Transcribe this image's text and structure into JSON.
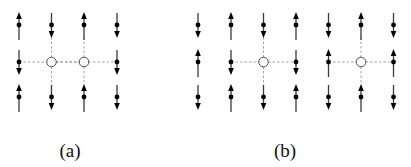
{
  "figure": {
    "panels": [
      {
        "id": "a",
        "label": "(a)",
        "label_pos": {
          "x": 70,
          "y": 140
        },
        "columns_x": [
          19,
          51.5,
          84,
          117
        ],
        "rows_y": [
          25,
          62,
          97
        ],
        "grid": [
          [
            "up",
            "down",
            "up",
            "down"
          ],
          [
            "down",
            "hole",
            "hole",
            "down"
          ],
          [
            "up",
            "down",
            "up",
            "down"
          ]
        ]
      },
      {
        "id": "b",
        "label": "(b)",
        "label_pos": {
          "x": 285,
          "y": 140
        },
        "columns_x": [
          198,
          231,
          263.5,
          296,
          328.5,
          361,
          393.5
        ],
        "rows_y": [
          25,
          62,
          97
        ],
        "grid": [
          [
            "down",
            "up",
            "down",
            "up",
            "down",
            "up",
            "down"
          ],
          [
            "up",
            "down",
            "hole",
            "down",
            "up",
            "hole",
            "up"
          ],
          [
            "down",
            "up",
            "down",
            "up",
            "down",
            "up",
            "down"
          ]
        ]
      }
    ],
    "legend_semantics": {
      "up": "spin-up arrow",
      "down": "spin-down arrow",
      "hole": "vacancy (hole) with dashed bonds to neighbors"
    },
    "colors": {
      "arrow": "#000000",
      "dashed_bond": "#9a9a9a",
      "hole_stroke": "#555555",
      "background": "#ffffff"
    }
  }
}
